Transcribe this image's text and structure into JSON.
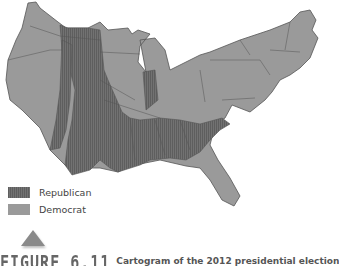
{
  "legend": {
    "items": [
      {
        "label": "Republican",
        "color": "#6e6e6e"
      },
      {
        "label": "Democrat",
        "color": "#9a9a9a"
      }
    ]
  },
  "caption": {
    "figure_number": "FIGURE 6.11",
    "text": "Cartogram of the 2012 presidential election"
  },
  "colors": {
    "republican": "#6e6e6e",
    "democrat": "#9a9a9a",
    "border": "#555555"
  }
}
